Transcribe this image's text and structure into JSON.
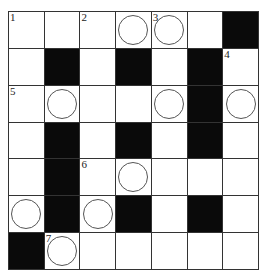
{
  "puzzle": {
    "rows": 7,
    "cols": 7,
    "grid": [
      [
        {
          "t": "w",
          "n": "1"
        },
        {
          "t": "w"
        },
        {
          "t": "w",
          "n": "2"
        },
        {
          "t": "c"
        },
        {
          "t": "c",
          "n": "3"
        },
        {
          "t": "w"
        },
        {
          "t": "b"
        }
      ],
      [
        {
          "t": "w"
        },
        {
          "t": "b"
        },
        {
          "t": "w"
        },
        {
          "t": "b"
        },
        {
          "t": "w"
        },
        {
          "t": "b"
        },
        {
          "t": "w",
          "n": "4"
        }
      ],
      [
        {
          "t": "w",
          "n": "5"
        },
        {
          "t": "c"
        },
        {
          "t": "w"
        },
        {
          "t": "w"
        },
        {
          "t": "c"
        },
        {
          "t": "b"
        },
        {
          "t": "c"
        }
      ],
      [
        {
          "t": "w"
        },
        {
          "t": "b"
        },
        {
          "t": "w"
        },
        {
          "t": "b"
        },
        {
          "t": "w"
        },
        {
          "t": "b"
        },
        {
          "t": "w"
        }
      ],
      [
        {
          "t": "w"
        },
        {
          "t": "b"
        },
        {
          "t": "w",
          "n": "6"
        },
        {
          "t": "c"
        },
        {
          "t": "w"
        },
        {
          "t": "w"
        },
        {
          "t": "w"
        }
      ],
      [
        {
          "t": "c"
        },
        {
          "t": "b"
        },
        {
          "t": "c"
        },
        {
          "t": "b"
        },
        {
          "t": "w"
        },
        {
          "t": "b"
        },
        {
          "t": "w"
        }
      ],
      [
        {
          "t": "b"
        },
        {
          "t": "c",
          "n": "7"
        },
        {
          "t": "w"
        },
        {
          "t": "w"
        },
        {
          "t": "w"
        },
        {
          "t": "w"
        },
        {
          "t": "w"
        }
      ]
    ]
  }
}
